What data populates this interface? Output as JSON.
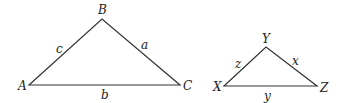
{
  "diagram": {
    "title": "",
    "triangles": [
      {
        "name": "ABC",
        "vertices": [
          {
            "label": "A",
            "x": 29,
            "y": 85
          },
          {
            "label": "B",
            "x": 102,
            "y": 19
          },
          {
            "label": "C",
            "x": 180,
            "y": 85
          }
        ],
        "sides": [
          {
            "label": "c",
            "between": "A-B"
          },
          {
            "label": "a",
            "between": "B-C"
          },
          {
            "label": "b",
            "between": "A-C"
          }
        ]
      },
      {
        "name": "XYZ",
        "vertices": [
          {
            "label": "X",
            "x": 224,
            "y": 86
          },
          {
            "label": "Y",
            "x": 266,
            "y": 47
          },
          {
            "label": "Z",
            "x": 317,
            "y": 86
          }
        ],
        "sides": [
          {
            "label": "z",
            "between": "X-Y"
          },
          {
            "label": "x",
            "between": "Y-Z"
          },
          {
            "label": "y",
            "between": "X-Z"
          }
        ]
      }
    ],
    "colors": {
      "stroke": "#333333",
      "text": "#222222",
      "background": "#ffffff"
    }
  }
}
